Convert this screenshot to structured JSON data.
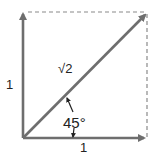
{
  "diagram": {
    "title": "",
    "labels": {
      "hypotenuse": "√2",
      "left_side": "1",
      "bottom_side": "1",
      "angle": "45°"
    },
    "colors": {
      "vector": "#6e6e6e",
      "dashed": "#8a8a8a",
      "text": "#222222"
    }
  }
}
